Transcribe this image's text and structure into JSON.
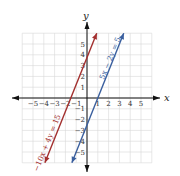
{
  "chart_data": {
    "type": "line",
    "title": "",
    "xlabel": "x",
    "ylabel": "y",
    "xlim": [
      -6,
      6
    ],
    "ylim": [
      -6,
      6
    ],
    "grid": true,
    "x_ticks": [
      "−5",
      "−4",
      "−3",
      "−2",
      "−1",
      "1",
      "2",
      "3",
      "4",
      "5"
    ],
    "y_ticks": [
      "5",
      "4",
      "3",
      "2",
      "1",
      "−1",
      "−2",
      "−3",
      "−4",
      "−5"
    ],
    "series": [
      {
        "name": "−10x + 4y = 15",
        "equation": "−10x + 4y = 15",
        "slope": 2.5,
        "intercept": 3.75,
        "color": "#a3302f",
        "x": [
          -3.9,
          0.9
        ],
        "y": [
          -6.0,
          6.0
        ]
      },
      {
        "name": "5x − 2y = 5",
        "equation": "5x − 2y = 5",
        "slope": 2.5,
        "intercept": -2.5,
        "color": "#3a5f9e",
        "x": [
          -1.4,
          3.4
        ],
        "y": [
          -6.0,
          6.0
        ]
      }
    ]
  },
  "labels": {
    "x_axis": "x",
    "y_axis": "y",
    "line1_equation": "−10x + 4y = 15",
    "line2_equation": "5x − 2y = 5"
  }
}
